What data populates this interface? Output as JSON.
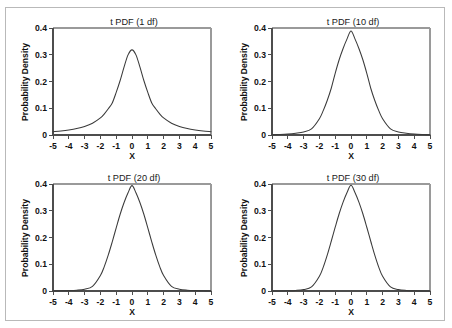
{
  "figure": {
    "border_color": "#b9b9b9",
    "background": "#ffffff",
    "curve_color": "#3a3a3a",
    "axis_color": "#4d4d4d"
  },
  "chart_data": [
    {
      "type": "line",
      "title": "t PDF (1 df)",
      "xlabel": "X",
      "ylabel": "Probability Density",
      "xlim": [
        -5,
        5
      ],
      "ylim": [
        0,
        0.4
      ],
      "grid": false,
      "legend": null,
      "df": 1,
      "peak": 0.318,
      "xticks": [
        "-5",
        "-4",
        "-3",
        "-2",
        "-1",
        "0",
        "1",
        "2",
        "3",
        "4",
        "5"
      ],
      "yticks": [
        "0",
        "0.1",
        "0.2",
        "0.3",
        "0.4"
      ],
      "x": [
        -5,
        -4.5,
        -4,
        -3.5,
        -3,
        -2.5,
        -2,
        -1.75,
        -1.5,
        -1.25,
        -1,
        -0.75,
        -0.5,
        -0.25,
        0,
        0.25,
        0.5,
        0.75,
        1,
        1.25,
        1.5,
        1.75,
        2,
        2.5,
        3,
        3.5,
        4,
        4.5,
        5
      ],
      "values": [
        0.0122,
        0.015,
        0.0187,
        0.0239,
        0.0318,
        0.0439,
        0.0637,
        0.0792,
        0.098,
        0.1198,
        0.1592,
        0.2037,
        0.2546,
        0.2996,
        0.3183,
        0.2996,
        0.2546,
        0.2037,
        0.1592,
        0.1198,
        0.098,
        0.0792,
        0.0637,
        0.0439,
        0.0318,
        0.0239,
        0.0187,
        0.015,
        0.0122
      ]
    },
    {
      "type": "line",
      "title": "t PDF (10 df)",
      "xlabel": "X",
      "ylabel": "Probability Density",
      "xlim": [
        -5,
        5
      ],
      "ylim": [
        0,
        0.4
      ],
      "grid": false,
      "legend": null,
      "df": 10,
      "peak": 0.389,
      "xticks": [
        "-5",
        "-4",
        "-3",
        "-2",
        "-1",
        "0",
        "1",
        "2",
        "3",
        "4",
        "5"
      ],
      "yticks": [
        "0",
        "0.1",
        "0.2",
        "0.3",
        "0.4"
      ],
      "x": [
        -5,
        -4.5,
        -4,
        -3.5,
        -3,
        -2.5,
        -2,
        -1.75,
        -1.5,
        -1.25,
        -1,
        -0.75,
        -0.5,
        -0.25,
        0,
        0.25,
        0.5,
        0.75,
        1,
        1.25,
        1.5,
        1.75,
        2,
        2.5,
        3,
        3.5,
        4,
        4.5,
        5
      ],
      "values": [
        0.0011,
        0.0019,
        0.0035,
        0.0065,
        0.0114,
        0.0231,
        0.0611,
        0.092,
        0.1299,
        0.1748,
        0.2304,
        0.2812,
        0.3234,
        0.3594,
        0.3891,
        0.3594,
        0.3234,
        0.2812,
        0.2304,
        0.1748,
        0.1299,
        0.092,
        0.0611,
        0.0231,
        0.0114,
        0.0065,
        0.0035,
        0.0019,
        0.0011
      ]
    },
    {
      "type": "line",
      "title": "t PDF (20 df)",
      "xlabel": "X",
      "ylabel": "Probability Density",
      "xlim": [
        -5,
        5
      ],
      "ylim": [
        0,
        0.4
      ],
      "grid": false,
      "legend": null,
      "df": 20,
      "peak": 0.394,
      "xticks": [
        "-5",
        "-4",
        "-3",
        "-2",
        "-1",
        "0",
        "1",
        "2",
        "3",
        "4",
        "5"
      ],
      "yticks": [
        "0",
        "0.1",
        "0.2",
        "0.3",
        "0.4"
      ],
      "x": [
        -5,
        -4.5,
        -4,
        -3.5,
        -3,
        -2.5,
        -2,
        -1.75,
        -1.5,
        -1.25,
        -1,
        -0.75,
        -0.5,
        -0.25,
        0,
        0.25,
        0.5,
        0.75,
        1,
        1.25,
        1.5,
        1.75,
        2,
        2.5,
        3,
        3.5,
        4,
        4.5,
        5
      ],
      "values": [
        0.0003,
        0.0006,
        0.0014,
        0.0031,
        0.0069,
        0.0175,
        0.058,
        0.092,
        0.1349,
        0.184,
        0.236,
        0.2869,
        0.3308,
        0.3673,
        0.394,
        0.3673,
        0.3308,
        0.2869,
        0.236,
        0.184,
        0.1349,
        0.092,
        0.058,
        0.0175,
        0.0069,
        0.0031,
        0.0014,
        0.0006,
        0.0003
      ]
    },
    {
      "type": "line",
      "title": "t PDF (30 df)",
      "xlabel": "X",
      "ylabel": "Probability Density",
      "xlim": [
        -5,
        5
      ],
      "ylim": [
        0,
        0.4
      ],
      "grid": false,
      "legend": null,
      "df": 30,
      "peak": 0.396,
      "xticks": [
        "-5",
        "-4",
        "-3",
        "-2",
        "-1",
        "0",
        "1",
        "2",
        "3",
        "4",
        "5"
      ],
      "yticks": [
        "0",
        "0.1",
        "0.2",
        "0.3",
        "0.4"
      ],
      "x": [
        -5,
        -4.5,
        -4,
        -3.5,
        -3,
        -2.5,
        -2,
        -1.75,
        -1.5,
        -1.25,
        -1,
        -0.75,
        -0.5,
        -0.25,
        0,
        0.25,
        0.5,
        0.75,
        1,
        1.25,
        1.5,
        1.75,
        2,
        2.5,
        3,
        3.5,
        4,
        4.5,
        5
      ],
      "values": [
        0.0001,
        0.0003,
        0.0009,
        0.0022,
        0.0055,
        0.0151,
        0.0549,
        0.0903,
        0.1352,
        0.186,
        0.2384,
        0.2887,
        0.3323,
        0.3685,
        0.3956,
        0.3685,
        0.3323,
        0.2887,
        0.2384,
        0.186,
        0.1352,
        0.0903,
        0.0549,
        0.0151,
        0.0055,
        0.0022,
        0.0009,
        0.0003,
        0.0001
      ]
    }
  ]
}
